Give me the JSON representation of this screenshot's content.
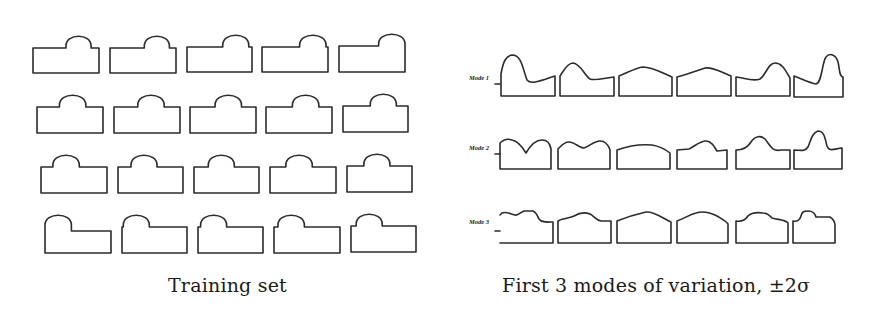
{
  "figure": {
    "left_panel": {
      "caption": "Training set",
      "rows": 4,
      "cols": 5,
      "shapes": [
        {
          "row": 0,
          "col": 0,
          "x": 33,
          "y": 48,
          "w": 66,
          "h": 25,
          "arch_start": 0.5,
          "arch_w": 0.38,
          "arch_h": 15
        },
        {
          "row": 0,
          "col": 1,
          "x": 110,
          "y": 48,
          "w": 66,
          "h": 25,
          "arch_start": 0.52,
          "arch_w": 0.38,
          "arch_h": 15
        },
        {
          "row": 0,
          "col": 2,
          "x": 187,
          "y": 47,
          "w": 65,
          "h": 25,
          "arch_start": 0.55,
          "arch_w": 0.4,
          "arch_h": 15
        },
        {
          "row": 0,
          "col": 3,
          "x": 262,
          "y": 47,
          "w": 66,
          "h": 25,
          "arch_start": 0.57,
          "arch_w": 0.4,
          "arch_h": 15
        },
        {
          "row": 0,
          "col": 4,
          "x": 339,
          "y": 46,
          "w": 66,
          "h": 26,
          "arch_start": 0.6,
          "arch_w": 0.4,
          "arch_h": 15
        },
        {
          "row": 1,
          "col": 0,
          "x": 37,
          "y": 107,
          "w": 66,
          "h": 26,
          "arch_start": 0.34,
          "arch_w": 0.4,
          "arch_h": 15
        },
        {
          "row": 1,
          "col": 1,
          "x": 114,
          "y": 107,
          "w": 66,
          "h": 26,
          "arch_start": 0.36,
          "arch_w": 0.4,
          "arch_h": 15
        },
        {
          "row": 1,
          "col": 2,
          "x": 190,
          "y": 107,
          "w": 66,
          "h": 26,
          "arch_start": 0.38,
          "arch_w": 0.4,
          "arch_h": 15
        },
        {
          "row": 1,
          "col": 3,
          "x": 266,
          "y": 107,
          "w": 66,
          "h": 26,
          "arch_start": 0.4,
          "arch_w": 0.4,
          "arch_h": 15
        },
        {
          "row": 1,
          "col": 4,
          "x": 343,
          "y": 106,
          "w": 65,
          "h": 26,
          "arch_start": 0.42,
          "arch_w": 0.4,
          "arch_h": 15
        },
        {
          "row": 2,
          "col": 0,
          "x": 41,
          "y": 167,
          "w": 66,
          "h": 26,
          "arch_start": 0.18,
          "arch_w": 0.4,
          "arch_h": 15
        },
        {
          "row": 2,
          "col": 1,
          "x": 118,
          "y": 167,
          "w": 65,
          "h": 26,
          "arch_start": 0.2,
          "arch_w": 0.4,
          "arch_h": 15
        },
        {
          "row": 2,
          "col": 2,
          "x": 194,
          "y": 167,
          "w": 65,
          "h": 26,
          "arch_start": 0.22,
          "arch_w": 0.4,
          "arch_h": 15
        },
        {
          "row": 2,
          "col": 3,
          "x": 270,
          "y": 167,
          "w": 66,
          "h": 26,
          "arch_start": 0.24,
          "arch_w": 0.4,
          "arch_h": 15
        },
        {
          "row": 2,
          "col": 4,
          "x": 347,
          "y": 166,
          "w": 65,
          "h": 26,
          "arch_start": 0.26,
          "arch_w": 0.4,
          "arch_h": 15
        },
        {
          "row": 3,
          "col": 0,
          "x": 45,
          "y": 227,
          "w": 66,
          "h": 26,
          "arch_start": 0.0,
          "arch_w": 0.4,
          "arch_h": 15
        },
        {
          "row": 3,
          "col": 1,
          "x": 122,
          "y": 227,
          "w": 65,
          "h": 26,
          "arch_start": 0.02,
          "arch_w": 0.4,
          "arch_h": 15
        },
        {
          "row": 3,
          "col": 2,
          "x": 198,
          "y": 227,
          "w": 65,
          "h": 26,
          "arch_start": 0.04,
          "arch_w": 0.4,
          "arch_h": 15
        },
        {
          "row": 3,
          "col": 3,
          "x": 274,
          "y": 227,
          "w": 66,
          "h": 26,
          "arch_start": 0.06,
          "arch_w": 0.4,
          "arch_h": 15
        },
        {
          "row": 3,
          "col": 4,
          "x": 351,
          "y": 226,
          "w": 65,
          "h": 26,
          "arch_start": 0.08,
          "arch_w": 0.4,
          "arch_h": 15
        }
      ]
    },
    "right_panel": {
      "caption": "First 3 modes of variation, ±2σ",
      "modes": [
        {
          "label": "Mode 1",
          "label_x": 468,
          "label_y": 78,
          "shapes": [
            "M501,96 L501,74 C503,62 506,55 513,55 C522,56 523,70 527,80 C531,85 540,81 555,76 L555,96 Z",
            "M560,96 L560,76 C563,72 567,63 573,63 C581,64 584,75 590,79 C595,81 605,78 614,77 L614,96 Z",
            "M619,96 L619,76 C627,73 635,68 643,67 C652,67 660,72 672,77 L672,96 Z",
            "M677,96 L677,77 C688,74 696,71 705,68 C713,67 721,72 731,76 L731,96 Z",
            "M736,96 L736,77 C745,78 753,82 760,79 C766,75 768,63 775,63 C783,63 786,72 790,78 L790,96 Z",
            "M794,97 L794,76 C802,79 810,83 816,84 C822,83 822,62 826,57 C830,52 836,55 838,62 C840,70 839,76 843,77 L843,97 Z"
          ]
        },
        {
          "label": "Mode 2",
          "label_x": 468,
          "label_y": 148,
          "shapes": [
            "M500,169 L500,143 C503,140 507,138 512,140 C518,141 523,148 526,153 C530,146 535,140 542,140 C547,140 550,143 551,149 L551,169 Z",
            "M558,169 L558,149 C561,146 564,142 569,142 C574,142 580,148 584,148 C590,146 594,141 600,141 C605,141 608,144 610,150 L610,169 Z",
            "M617,169 L617,150 C628,146 640,144 652,145 C658,146 665,149 670,153 L670,169 Z",
            "M677,169 L677,150 L689,149 C695,146 700,141 706,141 C711,141 714,146 717,151 L727,150 L727,169 Z",
            "M736,169 L736,150 C744,150 748,147 751,142 C755,136 761,135 765,139 C770,145 772,152 781,150 L790,150 L790,169 Z",
            "M794,169 L794,150 C800,150 805,152 808,147 C811,140 812,133 818,131 C824,131 825,138 827,146 C829,152 834,149 842,148 L842,169 Z"
          ]
        },
        {
          "label": "Mode 3",
          "label_x": 468,
          "label_y": 225,
          "shapes": [
            "M500,243 L553,243 L553,222 C547,222 542,223 539,219 C537,215 536,212 533,211 L524,211 C521,212 518,216 515,215 C510,214 506,211 502,213 C501,214 500,215 500,215",
            "M558,243 L558,221 C562,218 568,219 574,216 C579,213 585,212 590,214 C594,216 596,220 601,221 L611,221 L611,243 Z",
            "M617,243 L617,221 C627,217 637,214 646,212 C654,211 662,218 671,222 L671,243 Z",
            "M677,243 L677,221 C685,218 689,215 696,213 C702,211 709,212 717,216 C722,219 726,221 728,224 L728,243 Z",
            "M736,243 L736,221 C742,222 746,219 748,216 C751,213 756,212 763,213 C768,213 770,216 772,218 C778,220 784,219 788,223 L788,243 Z",
            "M793,243 L793,221 C797,222 800,220 801,216 C802,212 803,211 808,211 C813,211 815,213 816,217 L830,217 C833,219 835,221 835,225 L835,243 Z"
          ]
        }
      ]
    }
  }
}
